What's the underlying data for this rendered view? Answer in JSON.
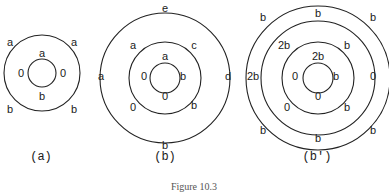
{
  "figure": {
    "caption": "Figure 10.3",
    "panels": [
      {
        "id": "a",
        "label": "(a)",
        "center": [
          42,
          73
        ],
        "radii": [
          14,
          38
        ],
        "edge_labels": [
          {
            "text": "a",
            "x": 42,
            "y": 53
          },
          {
            "text": "0",
            "x": 21,
            "y": 73
          },
          {
            "text": "0",
            "x": 63,
            "y": 73
          },
          {
            "text": "b",
            "x": 42,
            "y": 96
          },
          {
            "text": "a",
            "x": 10,
            "y": 42
          },
          {
            "text": "a",
            "x": 74,
            "y": 42
          },
          {
            "text": "b",
            "x": 10,
            "y": 109
          },
          {
            "text": "b",
            "x": 74,
            "y": 109
          }
        ],
        "caption_x": 41
      },
      {
        "id": "b",
        "label": "(b)",
        "center": [
          165,
          78
        ],
        "radii": [
          15,
          36,
          65
        ],
        "edge_labels": [
          {
            "text": "a",
            "x": 165,
            "y": 56
          },
          {
            "text": "0",
            "x": 144,
            "y": 76
          },
          {
            "text": "b",
            "x": 183,
            "y": 76
          },
          {
            "text": "0",
            "x": 165,
            "y": 96
          },
          {
            "text": "a",
            "x": 133,
            "y": 45
          },
          {
            "text": "c",
            "x": 194,
            "y": 45
          },
          {
            "text": "0",
            "x": 133,
            "y": 107
          },
          {
            "text": "b",
            "x": 194,
            "y": 105
          },
          {
            "text": "e",
            "x": 165,
            "y": 8
          },
          {
            "text": "a",
            "x": 101,
            "y": 76
          },
          {
            "text": "d",
            "x": 228,
            "y": 76
          },
          {
            "text": "b",
            "x": 165,
            "y": 145
          }
        ],
        "caption_x": 165
      },
      {
        "id": "b-prime",
        "label": "(b′)",
        "center": [
          318,
          78
        ],
        "radii": [
          15,
          36,
          57,
          72
        ],
        "edge_labels": [
          {
            "text": "2b",
            "x": 318,
            "y": 56
          },
          {
            "text": "0",
            "x": 295,
            "y": 76
          },
          {
            "text": "b",
            "x": 336,
            "y": 76
          },
          {
            "text": "0",
            "x": 318,
            "y": 96
          },
          {
            "text": "2b",
            "x": 284,
            "y": 45
          },
          {
            "text": "b",
            "x": 347,
            "y": 45
          },
          {
            "text": "0",
            "x": 287,
            "y": 107
          },
          {
            "text": "b",
            "x": 347,
            "y": 107
          },
          {
            "text": "b",
            "x": 318,
            "y": 13
          },
          {
            "text": "2b",
            "x": 253,
            "y": 76
          },
          {
            "text": "0",
            "x": 373,
            "y": 76
          },
          {
            "text": "b",
            "x": 318,
            "y": 138
          },
          {
            "text": "b",
            "x": 263,
            "y": 17
          },
          {
            "text": "b",
            "x": 373,
            "y": 17
          },
          {
            "text": "b",
            "x": 263,
            "y": 130
          },
          {
            "text": "b",
            "x": 373,
            "y": 130
          }
        ],
        "caption_x": 317
      }
    ]
  }
}
